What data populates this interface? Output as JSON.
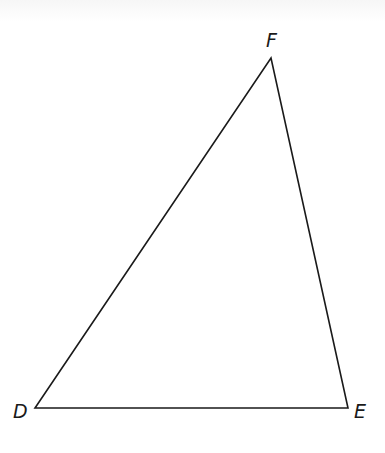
{
  "diagram": {
    "type": "triangle",
    "stroke_color": "#1a1a1a",
    "background_color": "#ffffff",
    "vertices": [
      {
        "label": "D",
        "x": 35,
        "y": 408,
        "label_x": 13,
        "label_y": 418
      },
      {
        "label": "E",
        "x": 348,
        "y": 408,
        "label_x": 354,
        "label_y": 418
      },
      {
        "label": "F",
        "x": 271,
        "y": 58,
        "label_x": 266,
        "label_y": 47
      }
    ],
    "sides": [
      {
        "name": "DE",
        "from": "D",
        "to": "E"
      },
      {
        "name": "EF",
        "from": "E",
        "to": "F"
      },
      {
        "name": "DF",
        "from": "D",
        "to": "F"
      }
    ]
  }
}
